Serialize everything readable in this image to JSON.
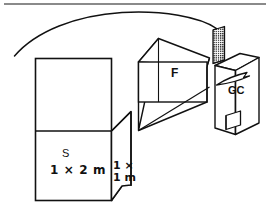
{
  "page": {
    "background_color": "#ffffff",
    "ink_color": "#111111",
    "rule_color": "#8a8a8a",
    "width": 269,
    "height": 219
  },
  "diagram": {
    "type": "hand-drawn-isometric-schematic",
    "labels": {
      "storage_box": "S",
      "storage_box_dimension": "1 × 2 m",
      "flap_dimension_line1": "1 ×",
      "flap_dimension_line2": "1 m",
      "funnel": "F",
      "gas_chamber": "GC"
    },
    "components": [
      {
        "name": "storage-box",
        "label": "S",
        "dimension": "1 × 2 m",
        "shape": "rectangular-box-with-horizontal-divider"
      },
      {
        "name": "connecting-flap",
        "label": "",
        "dimension": "1 × 1 m",
        "shape": "parallelogram-flap"
      },
      {
        "name": "funnel",
        "label": "F",
        "shape": "tapered-prism-funnel"
      },
      {
        "name": "grid-filter",
        "label": "",
        "shape": "cross-hatched-rectangle"
      },
      {
        "name": "gas-chamber",
        "label": "GC",
        "shape": "tall-transparent-box-with-inner-base-block"
      },
      {
        "name": "flow-arc",
        "label": "",
        "shape": "long-sweeping-arc"
      },
      {
        "name": "flow-arrow",
        "label": "",
        "shape": "leaf-arrow-pointing-right"
      }
    ]
  }
}
